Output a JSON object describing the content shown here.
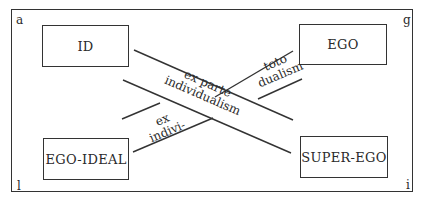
{
  "diagram": {
    "corners": {
      "top_left": "a",
      "top_right": "g",
      "bottom_left": "l",
      "bottom_right": "i"
    },
    "boxes": {
      "top_left": "ID",
      "top_right": "EGO",
      "bottom_left": "EGO-IDEAL",
      "bottom_right": "SUPER-EGO"
    },
    "bands": {
      "descending": {
        "line1": "ex parte",
        "line2": "individualism"
      },
      "ascending_upper": {
        "line1": "toto",
        "line2": "dualism"
      },
      "ascending_lower": {
        "line1": "ex",
        "line2": "indivi-"
      }
    },
    "colors": {
      "ink": "#2a2a2a",
      "background": "#ffffff"
    }
  }
}
